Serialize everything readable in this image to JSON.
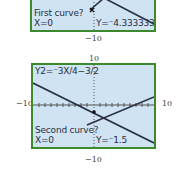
{
  "panel1": {
    "prompt": "First curve?",
    "x_value": "X=0",
    "y_value": "Y=⁻4.333333",
    "ymin_label": "−10"
  },
  "panel2": {
    "equation": "Y2=⁻3X/4−3/2",
    "prompt": "Second curve?",
    "x_value": "X=0",
    "y_value": "Y=⁻1.5",
    "ymax_label": "10",
    "ymin_label": "−10",
    "xmin_label": "−10",
    "xmax_label": "10"
  },
  "colors": {
    "screen_bg": "#cfe3f2",
    "frame": "#3d8a2e",
    "ink": "#2a2f45"
  }
}
